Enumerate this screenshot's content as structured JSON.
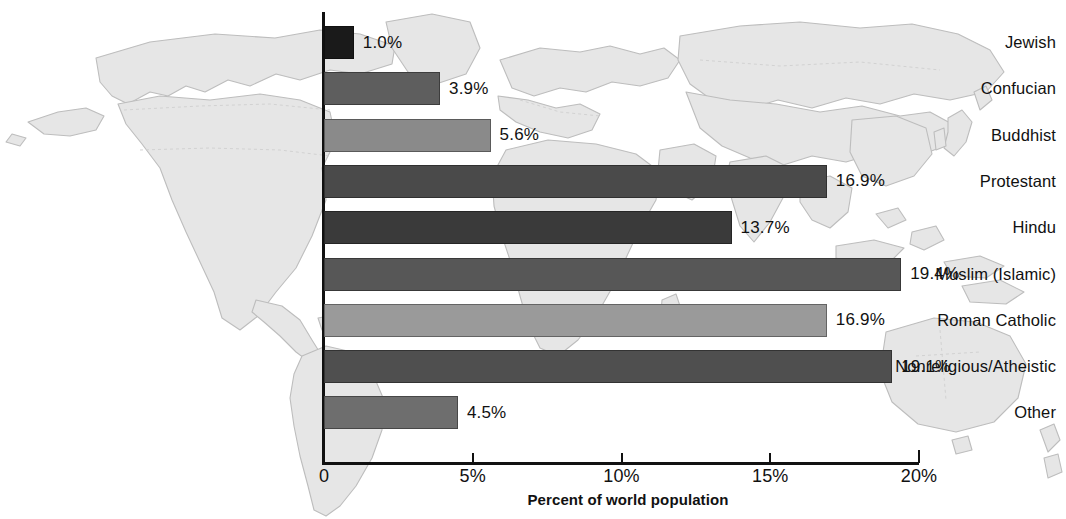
{
  "chart_data": {
    "type": "bar",
    "orientation": "horizontal",
    "title": "",
    "xlabel": "Percent of world population",
    "ylabel": "",
    "xlim": [
      0,
      20
    ],
    "xtick_labels": [
      "0",
      "5%",
      "10%",
      "15%",
      "20%"
    ],
    "xtick_values": [
      0,
      5,
      10,
      15,
      20
    ],
    "grid": false,
    "legend": null,
    "value_label_suffix": "%",
    "categories": [
      "Jewish",
      "Confucian",
      "Buddhist",
      "Protestant",
      "Hindu",
      "Muslim (Islamic)",
      "Roman Catholic",
      "Nonreligious/Atheistic",
      "Other"
    ],
    "values": [
      1.0,
      3.9,
      5.6,
      16.9,
      13.7,
      19.4,
      16.9,
      19.1,
      4.5
    ],
    "value_labels": [
      "1.0%",
      "3.9%",
      "5.6%",
      "16.9%",
      "13.7%",
      "19.4%",
      "16.9%",
      "19.1%",
      "4.5%"
    ],
    "bar_colors": [
      "#1a1a1a",
      "#5e5e5e",
      "#8a8a8a",
      "#4a4a4a",
      "#3a3a3a",
      "#575757",
      "#9a9a9a",
      "#4f4f4f",
      "#6e6e6e"
    ],
    "bars": [
      {
        "label": "Jewish",
        "value": 1.0,
        "value_label": "1.0%",
        "color": "#1a1a1a"
      },
      {
        "label": "Confucian",
        "value": 3.9,
        "value_label": "3.9%",
        "color": "#5e5e5e"
      },
      {
        "label": "Buddhist",
        "value": 5.6,
        "value_label": "5.6%",
        "color": "#8a8a8a"
      },
      {
        "label": "Protestant",
        "value": 16.9,
        "value_label": "16.9%",
        "color": "#4a4a4a"
      },
      {
        "label": "Hindu",
        "value": 13.7,
        "value_label": "13.7%",
        "color": "#3a3a3a"
      },
      {
        "label": "Muslim (Islamic)",
        "value": 19.4,
        "value_label": "19.4%",
        "color": "#575757"
      },
      {
        "label": "Roman Catholic",
        "value": 16.9,
        "value_label": "16.9%",
        "color": "#9a9a9a"
      },
      {
        "label": "Nonreligious/Atheistic",
        "value": 19.1,
        "value_label": "19.1%",
        "color": "#4f4f4f"
      },
      {
        "label": "Other",
        "value": 4.5,
        "value_label": "4.5%",
        "color": "#6e6e6e"
      }
    ],
    "background": {
      "watermark": "world-map",
      "watermark_color": "#e4e4e4",
      "watermark_outline_color": "#b9b9b9"
    }
  }
}
